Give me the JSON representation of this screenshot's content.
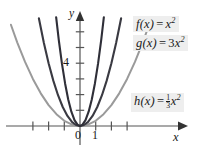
{
  "figure": {
    "name": "parabola-family-graph",
    "background": "#ffffff"
  },
  "axes": {
    "x_label": "x",
    "y_label": "y",
    "origin_label": "0",
    "x_tick_labels": [
      "1"
    ],
    "y_tick_labels": [
      "4"
    ],
    "x_ticks_left_of_origin": 3,
    "x_ticks_right_of_origin": 3,
    "y_ticks_above_origin": 6,
    "axis_color": "#555555",
    "arrow_color": "#333333"
  },
  "labels": {
    "f": {
      "name": "f",
      "arg": "(x)",
      "equals": "=",
      "coefficient": "",
      "variable": "x",
      "exponent": "2",
      "full_text": "f(x) = x2",
      "box_background": "#eeeeee"
    },
    "g": {
      "name": "g",
      "arg": "(x)",
      "equals": "=",
      "coefficient": "3",
      "variable": "x",
      "exponent": "2",
      "full_text": "g(x) = 3x2",
      "box_background": "#eeeeee"
    },
    "h": {
      "name": "h",
      "arg": "(x)",
      "equals": "=",
      "numerator": "1",
      "denominator": "3",
      "variable": "x",
      "exponent": "2",
      "full_text": "h(x) = 1/3 x2",
      "box_background": "#eeeeee"
    }
  },
  "chart_data": {
    "type": "line",
    "title": "",
    "xlabel": "x",
    "ylabel": "y",
    "xlim": [
      -3.4,
      3.6
    ],
    "ylim": [
      -0.6,
      7.5
    ],
    "grid": false,
    "legend_position": "right",
    "axis_ticks": {
      "x": [
        -3,
        -2,
        -1,
        0,
        1,
        2,
        3
      ],
      "y": [
        1,
        2,
        3,
        4,
        5,
        6
      ],
      "x_labeled": [
        0,
        1
      ],
      "y_labeled": [
        4
      ]
    },
    "series": [
      {
        "name": "f(x) = x^2",
        "coefficient": 1,
        "color": "#3a3a42",
        "width": 2.1,
        "x": [
          -2.62,
          -2.3,
          -2.0,
          -1.7,
          -1.4,
          -1.1,
          -0.8,
          -0.5,
          -0.25,
          0,
          0.25,
          0.5,
          0.8,
          1.1,
          1.4,
          1.7,
          2.0,
          2.3,
          2.62
        ],
        "y": [
          6.86,
          5.29,
          4.0,
          2.89,
          1.96,
          1.21,
          0.64,
          0.25,
          0.0625,
          0,
          0.0625,
          0.25,
          0.64,
          1.21,
          1.96,
          2.89,
          4.0,
          5.29,
          6.86
        ]
      },
      {
        "name": "g(x) = 3x^2",
        "coefficient": 3,
        "color": "#2f2f38",
        "width": 2.1,
        "x": [
          -1.52,
          -1.35,
          -1.15,
          -0.95,
          -0.75,
          -0.55,
          -0.35,
          -0.15,
          0,
          0.15,
          0.35,
          0.55,
          0.75,
          0.95,
          1.15,
          1.35,
          1.52
        ],
        "y": [
          6.93,
          5.47,
          3.97,
          2.71,
          1.69,
          0.91,
          0.37,
          0.07,
          0,
          0.07,
          0.37,
          0.91,
          1.69,
          2.71,
          3.97,
          5.47,
          6.93
        ]
      },
      {
        "name": "h(x) = (1/3)x^2",
        "coefficient": 0.3333,
        "color": "#9a9a9a",
        "width": 2.0,
        "x": [
          -4.4,
          -4.0,
          -3.5,
          -3.0,
          -2.5,
          -2.0,
          -1.5,
          -1.0,
          -0.5,
          0,
          0.5,
          1.0,
          1.5,
          2.0,
          2.5,
          3.0,
          3.5,
          4.0,
          4.4
        ],
        "y": [
          6.45,
          5.33,
          4.08,
          3.0,
          2.08,
          1.33,
          0.75,
          0.33,
          0.083,
          0,
          0.083,
          0.33,
          0.75,
          1.33,
          2.08,
          3.0,
          4.08,
          5.33,
          6.45
        ]
      }
    ]
  }
}
